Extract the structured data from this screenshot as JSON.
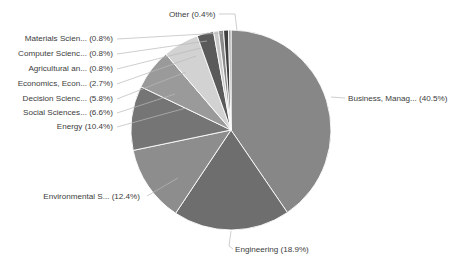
{
  "chart_data": {
    "type": "pie",
    "title": "",
    "legend_position": "none",
    "label_format": "{name} ({percent}%)",
    "start_angle_deg": 0,
    "direction": "clockwise",
    "center": {
      "x": 231,
      "y": 130
    },
    "radius": 100,
    "categories": [
      "Business, Manag...",
      "Engineering",
      "Environmental S...",
      "Energy",
      "Social Sciences...",
      "Decision Scienc...",
      "Economics, Econ...",
      "Agricultural an...",
      "Computer Scienc...",
      "Materials Scien...",
      "Other"
    ],
    "values": [
      40.5,
      18.9,
      12.4,
      10.4,
      6.6,
      5.8,
      2.7,
      0.8,
      0.8,
      0.8,
      0.4
    ],
    "colors": [
      "#878787",
      "#6e6e6e",
      "#8d8d8d",
      "#757575",
      "#9a9a9a",
      "#d2d2d2",
      "#5a5a5a",
      "#c9c9c9",
      "#8a8a8a",
      "#3f3f3f",
      "#9e9e9e"
    ],
    "labels": [
      "Business, Manag... (40.5%)",
      "Engineering (18.9%)",
      "Environmental S... (12.4%)",
      "Energy (10.4%)",
      "Social Sciences... (6.6%)",
      "Decision Scienc... (5.8%)",
      "Economics, Econ... (2.7%)",
      "Agricultural an... (0.8%)",
      "Computer Scienc... (0.8%)",
      "Materials Scien... (0.8%)",
      "Other (0.4%)"
    ],
    "label_positions": [
      {
        "x": 348,
        "y": 101,
        "anchor": "start"
      },
      {
        "x": 235,
        "y": 252,
        "anchor": "start"
      },
      {
        "x": 140,
        "y": 199,
        "anchor": "end"
      },
      {
        "x": 113,
        "y": 129,
        "anchor": "end"
      },
      {
        "x": 113,
        "y": 115,
        "anchor": "end"
      },
      {
        "x": 113,
        "y": 101,
        "anchor": "end"
      },
      {
        "x": 113,
        "y": 86,
        "anchor": "end"
      },
      {
        "x": 113,
        "y": 71,
        "anchor": "end"
      },
      {
        "x": 113,
        "y": 56,
        "anchor": "end"
      },
      {
        "x": 113,
        "y": 41,
        "anchor": "end"
      },
      {
        "x": 169,
        "y": 17,
        "anchor": "start"
      }
    ],
    "leader_lines": [
      "M331,97 L345,98",
      "M231,231 L229,246 L233,249",
      "M147,196 L178,178",
      "M117,127 L186,108",
      "M117,113 L175,94",
      "M117,99 L186,72",
      "M117,84 L196,56",
      "M117,69 L201,48",
      "M117,54 L207,41",
      "M117,39 L222,33",
      "M219,14 L235,14 L237,31"
    ]
  },
  "axes": {
    "xlabel": "",
    "ylabel": "",
    "grid": false
  }
}
